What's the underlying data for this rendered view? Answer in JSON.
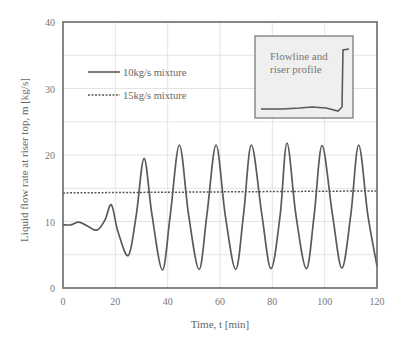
{
  "chart_data": {
    "type": "line",
    "title": "",
    "xlabel": "Time, t [min]",
    "ylabel": "Liquid flow rate at riser top, m [kg/s]",
    "xlim": [
      0,
      120
    ],
    "ylim": [
      0,
      40
    ],
    "xticks": [
      0,
      20,
      40,
      60,
      80,
      100,
      120
    ],
    "yticks": [
      0,
      10,
      20,
      30,
      40
    ],
    "grid": true,
    "legend_position": "upper-left",
    "series": [
      {
        "name": "10kg/s mixture",
        "style": "solid",
        "x": [
          0,
          3,
          6,
          9,
          13,
          16,
          18.5,
          21,
          25,
          28,
          31,
          34,
          38,
          41,
          44.5,
          48,
          52,
          55,
          58.5,
          62,
          66,
          69,
          72,
          76,
          79.5,
          83,
          85.6,
          89,
          93,
          96,
          99,
          103,
          106.6,
          110,
          113,
          116.5,
          120
        ],
        "y": [
          9.5,
          9.5,
          9.9,
          9.4,
          8.7,
          10.2,
          12.5,
          8.5,
          4.9,
          11,
          19.5,
          11,
          2.7,
          11,
          21.5,
          11,
          2.8,
          11,
          21.5,
          11,
          2.8,
          11,
          21.5,
          11,
          2.9,
          11,
          21.8,
          11,
          2.9,
          11,
          21.4,
          11,
          3.0,
          11,
          21.5,
          11,
          3.3
        ]
      },
      {
        "name": "15kg/s mixture",
        "style": "dashed",
        "x": [
          0,
          120
        ],
        "y": [
          14.3,
          14.6
        ]
      }
    ],
    "annotations": [
      {
        "text": "Flowline and riser profile",
        "type": "inset",
        "position": "upper-right"
      }
    ]
  },
  "labels": {
    "xlabel": "Time, t [min]",
    "ylabel": "Liquid flow rate at riser top, m [kg/s]",
    "legend_solid": "10kg/s mixture",
    "legend_dashed": "15kg/s mixture",
    "inset_line1": "Flowline and",
    "inset_line2": "riser profile"
  },
  "colors": {
    "line": "#5a5a5a",
    "axis": "#6a6a6a",
    "grid": "#e4e4e4",
    "inset_bg": "#efefef"
  }
}
